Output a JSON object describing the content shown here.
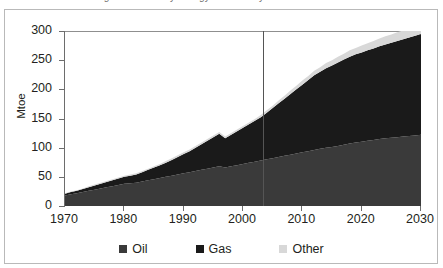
{
  "figure": {
    "title_cropped": "Figure 3: Primary energy demand by fuel",
    "y_axis_title": "Mtoe"
  },
  "legend": {
    "items": [
      {
        "label": "Oil",
        "color": "#3a3a3a"
      },
      {
        "label": "Gas",
        "color": "#1a1a1a"
      },
      {
        "label": "Other",
        "color": "#d8d8d8"
      }
    ]
  },
  "chart_data": {
    "type": "area",
    "stacked": true,
    "title": "Figure 3: Primary energy demand by fuel",
    "xlabel": "",
    "ylabel": "Mtoe",
    "xlim": [
      1970,
      2030
    ],
    "ylim": [
      0,
      300
    ],
    "ytick_labels": [
      "0",
      "50",
      "100",
      "150",
      "200",
      "250",
      "300"
    ],
    "ytick_values": [
      0,
      50,
      100,
      150,
      200,
      250,
      300
    ],
    "xtick_labels": [
      "1970",
      "1980",
      "1990",
      "2000",
      "2010",
      "2020",
      "2030"
    ],
    "xtick_values": [
      1970,
      1980,
      1990,
      2000,
      2010,
      2020,
      2030
    ],
    "grid": false,
    "legend_position": "bottom",
    "annotations": [
      {
        "type": "vertical-line",
        "x": 2003,
        "label": "history / projection divider"
      }
    ],
    "x": [
      1970,
      1971,
      1972,
      1973,
      1974,
      1975,
      1976,
      1977,
      1978,
      1979,
      1980,
      1981,
      1982,
      1983,
      1984,
      1985,
      1986,
      1987,
      1988,
      1989,
      1990,
      1991,
      1992,
      1993,
      1994,
      1995,
      1996,
      1997,
      1998,
      1999,
      2000,
      2001,
      2002,
      2003,
      2004,
      2005,
      2006,
      2007,
      2008,
      2009,
      2010,
      2011,
      2012,
      2013,
      2014,
      2015,
      2016,
      2017,
      2018,
      2019,
      2020,
      2021,
      2022,
      2023,
      2024,
      2025,
      2026,
      2027,
      2028,
      2029,
      2030
    ],
    "series": [
      {
        "name": "Oil",
        "color": "#3a3a3a",
        "values": [
          18,
          20,
          22,
          24,
          26,
          28,
          30,
          32,
          34,
          36,
          38,
          39,
          40,
          42,
          44,
          46,
          48,
          50,
          52,
          54,
          56,
          58,
          60,
          62,
          64,
          66,
          68,
          66,
          68,
          70,
          72,
          74,
          76,
          78,
          80,
          82,
          84,
          86,
          88,
          90,
          92,
          94,
          96,
          98,
          100,
          101,
          103,
          105,
          107,
          109,
          110,
          112,
          113,
          115,
          116,
          117,
          118,
          119,
          120,
          121,
          122
        ]
      },
      {
        "name": "Gas",
        "color": "#1a1a1a",
        "values": [
          3,
          4,
          4,
          5,
          6,
          7,
          8,
          9,
          10,
          11,
          12,
          13,
          14,
          16,
          18,
          20,
          22,
          24,
          27,
          30,
          33,
          36,
          40,
          44,
          48,
          52,
          56,
          50,
          54,
          58,
          62,
          66,
          70,
          74,
          80,
          86,
          92,
          98,
          104,
          110,
          116,
          122,
          128,
          132,
          136,
          140,
          143,
          146,
          149,
          151,
          153,
          155,
          157,
          159,
          161,
          163,
          165,
          167,
          169,
          171,
          173
        ]
      },
      {
        "name": "Other",
        "color": "#d8d8d8",
        "values": [
          1,
          1,
          1,
          1,
          2,
          2,
          2,
          2,
          2,
          2,
          2,
          2,
          2,
          2,
          2,
          2,
          2,
          3,
          3,
          3,
          3,
          3,
          3,
          3,
          3,
          3,
          3,
          3,
          3,
          3,
          3,
          3,
          3,
          4,
          4,
          4,
          5,
          5,
          6,
          6,
          7,
          7,
          8,
          8,
          9,
          9,
          10,
          10,
          11,
          11,
          12,
          12,
          13,
          13,
          14,
          14,
          15,
          15,
          16,
          16,
          17
        ]
      }
    ]
  }
}
